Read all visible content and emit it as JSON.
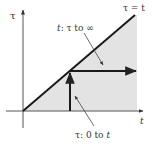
{
  "diagram": {
    "axes": {
      "x_label": "t",
      "y_label": "τ"
    },
    "line_label": "τ = t",
    "annotations": {
      "upper": {
        "var": "t",
        "range": ": τ to ∞"
      },
      "lower": {
        "var": "τ",
        "range": ": 0 to ",
        "end": "t"
      }
    },
    "colors": {
      "shade": "#e3e3e3",
      "line": "#1a1a1a",
      "axis": "#555555",
      "pointer": "#444444"
    }
  }
}
